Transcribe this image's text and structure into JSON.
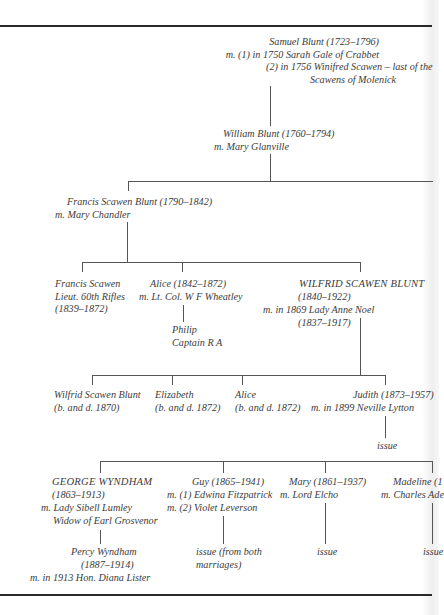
{
  "document": {
    "type": "family tree",
    "generations": [
      {
        "level": 1,
        "people": [
          {
            "id": "samuel",
            "lines": [
              "Samuel Blunt (1723–1796)",
              "m. (1) in 1750 Sarah Gale of Crabbet",
              "(2) in 1756 Winifred Scawen – last of the",
              "Scawens of Molenick"
            ]
          }
        ]
      },
      {
        "level": 2,
        "people": [
          {
            "id": "william",
            "lines": [
              "William Blunt (1760–1794)",
              "m. Mary Glanville"
            ]
          }
        ]
      },
      {
        "level": 3,
        "people": [
          {
            "id": "francis_sr",
            "lines": [
              "Francis Scawen Blunt (1790–1842)",
              "m. Mary Chandler"
            ]
          }
        ]
      },
      {
        "level": 4,
        "people": [
          {
            "id": "francis_jr",
            "lines": [
              "Francis Scawen",
              "Lieut. 60th Rifles",
              "(1839–1872)"
            ]
          },
          {
            "id": "alice_sr",
            "lines": [
              "Alice (1842–1872)",
              "m. Lt. Col. W F Wheatley"
            ]
          },
          {
            "id": "philip",
            "lines": [
              "Philip",
              "Captain R A"
            ]
          },
          {
            "id": "wilfrid",
            "lines": [
              "WILFRID SCAWEN BLUNT",
              "(1840–1922)",
              "m. in 1869 Lady Anne Noel",
              "(1837–1917)"
            ]
          }
        ]
      },
      {
        "level": 5,
        "people": [
          {
            "id": "wilfrid_jr",
            "lines": [
              "Wilfrid Scawen Blunt",
              "(b. and d. 1870)"
            ]
          },
          {
            "id": "elizabeth",
            "lines": [
              "Elizabeth",
              "(b. and d. 1872)"
            ]
          },
          {
            "id": "alice_jr",
            "lines": [
              "Alice",
              "(b. and d. 1872)"
            ]
          },
          {
            "id": "judith",
            "lines": [
              "Judith (1873–1957)",
              "m. in 1899 Neville Lytton"
            ]
          },
          {
            "id": "judith_issue",
            "lines": [
              "issue"
            ]
          }
        ]
      },
      {
        "level": 6,
        "people": [
          {
            "id": "george",
            "lines": [
              "GEORGE WYNDHAM",
              "(1863–1913)",
              "m. Lady Sibell Lumley",
              "Widow of Earl Grosvenor"
            ]
          },
          {
            "id": "guy",
            "lines": [
              "Guy (1865–1941)",
              "m. (1) Edwina Fitzpatrick",
              "m. (2) Violet Leverson"
            ]
          },
          {
            "id": "mary",
            "lines": [
              "Mary (1861–1937)",
              "m. Lord Elcho"
            ]
          },
          {
            "id": "madeline",
            "lines": [
              "Madeline (1",
              "m. Charles Ade"
            ]
          }
        ]
      },
      {
        "level": 7,
        "people": [
          {
            "id": "percy",
            "lines": [
              "Percy Wyndham",
              "(1887–1914)",
              "m. in 1913 Hon. Diana Lister"
            ]
          },
          {
            "id": "guy_issue",
            "lines": [
              "issue (from both",
              "marriages)"
            ]
          },
          {
            "id": "mary_issue",
            "lines": [
              "issue"
            ]
          },
          {
            "id": "madeline_issue",
            "lines": [
              "issue"
            ]
          }
        ]
      }
    ]
  },
  "colors": {
    "text": "#3c3c3c",
    "rules": "#2a2a2a",
    "connectors": "#555555",
    "paper": "#ffffff"
  }
}
